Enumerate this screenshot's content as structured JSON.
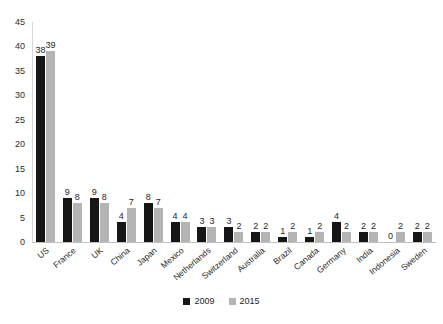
{
  "chart_data": {
    "type": "bar",
    "title": "",
    "subtitle": "",
    "xlabel": "",
    "ylabel": "",
    "ylim": [
      0,
      45
    ],
    "yticks": [
      0,
      5,
      10,
      15,
      20,
      25,
      30,
      35,
      40,
      45
    ],
    "grid": false,
    "legend_position": "bottom-center",
    "categories": [
      "US",
      "France",
      "UK",
      "China",
      "Japan",
      "Mexico",
      "Netherlands",
      "Switzerland",
      "Australia",
      "Brazil",
      "Canada",
      "Germany",
      "India",
      "Indonesia",
      "Sweden"
    ],
    "series": [
      {
        "name": "2009",
        "color": "#161616",
        "values": [
          38,
          9,
          9,
          4,
          8,
          4,
          3,
          3,
          2,
          1,
          1,
          4,
          2,
          0,
          2
        ]
      },
      {
        "name": "2015",
        "color": "#b4b4b4",
        "values": [
          39,
          8,
          8,
          7,
          7,
          4,
          3,
          2,
          2,
          2,
          2,
          2,
          2,
          2,
          2
        ]
      }
    ]
  }
}
